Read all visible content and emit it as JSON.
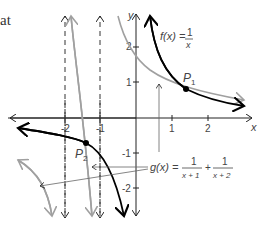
{
  "text_fragment": "at",
  "axes": {
    "x_label": "x",
    "y_label": "y",
    "x_ticks": [
      "-2",
      "-1",
      "1",
      "2"
    ],
    "y_ticks": [
      "2",
      "1",
      "-1",
      "-2"
    ]
  },
  "functions": {
    "f": {
      "name": "f(x) =",
      "num": "1",
      "den": "x",
      "color": "#000000"
    },
    "g": {
      "name": "g(x) =",
      "num1": "1",
      "den1": "x + 1",
      "plus": "+",
      "num2": "1",
      "den2": "x + 2",
      "color": "#999999"
    }
  },
  "points": {
    "p1": {
      "label": "P",
      "sub": "1"
    },
    "p2": {
      "label": "P",
      "sub": "2"
    }
  },
  "asymptotes": [
    "x = -2",
    "x = -1"
  ],
  "colors": {
    "axis": "#222222",
    "f_curve": "#000000",
    "g_curve": "#a0a0a0",
    "asymptote": "#333333"
  }
}
